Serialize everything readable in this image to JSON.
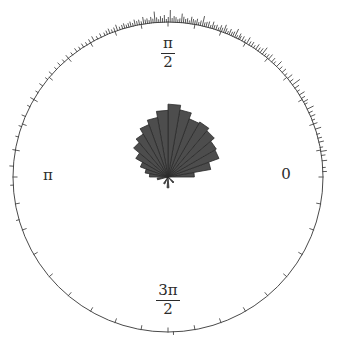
{
  "figure": {
    "kind": "polar-rose-diagram",
    "background_color": "#ffffff",
    "axis_color": "#4a4a4a",
    "petal_fill_color": "#4d4d4d",
    "petal_stroke_color": "#2b2b2b",
    "rug_color": "#3a3a3a",
    "label_color": "#2b2b2b"
  },
  "axis_labels": {
    "right": "0",
    "top_numerator": "π",
    "top_denominator": "2",
    "left": "π",
    "bottom_numerator": "3π",
    "bottom_denominator": "2"
  },
  "chart_data": {
    "type": "bar",
    "subtype": "polar-rose-histogram-with-rug",
    "title": "",
    "xlabel": "",
    "ylabel": "",
    "grid": false,
    "legend": null,
    "angle_unit": "radians",
    "angle_direction": "counterclockwise",
    "angle_zero_at": "east",
    "axis_tick_labels": [
      "0",
      "π/2",
      "π",
      "3π/2"
    ],
    "axis_tick_angles_rad": [
      0,
      1.5708,
      3.1416,
      4.7124
    ],
    "minor_tick_count": 36,
    "minor_tick_spacing_rad": 0.1745,
    "outer_radius_px": 155,
    "center_px": [
      168,
      177
    ],
    "rose": {
      "description": "Angular histogram petals radiating from center; bin width approx 0.175 rad (10 deg); radius proportional to sqrt of bin count; max petal radius approx 0.46 of outer radius.",
      "bin_width_rad": 0.1745,
      "bin_centers_rad": [
        0.0873,
        0.2618,
        0.4363,
        0.6109,
        0.7854,
        0.9599,
        1.1345,
        1.309,
        1.4835,
        1.6581,
        1.8326,
        2.0071,
        2.1817,
        2.3562,
        2.5307,
        2.7053,
        2.8798,
        3.0543,
        3.3161,
        4.1888,
        4.7124,
        5.4978
      ],
      "bin_centers_deg": [
        5,
        15,
        25,
        35,
        45,
        55,
        65,
        75,
        85,
        95,
        105,
        115,
        125,
        135,
        145,
        155,
        165,
        175,
        190,
        240,
        270,
        315
      ],
      "counts": [
        9,
        24,
        38,
        41,
        46,
        52,
        49,
        61,
        70,
        57,
        48,
        40,
        33,
        27,
        19,
        12,
        7,
        5,
        2,
        1,
        2,
        1
      ],
      "radii_fraction_of_outer": [
        0.17,
        0.28,
        0.35,
        0.36,
        0.39,
        0.41,
        0.4,
        0.44,
        0.47,
        0.43,
        0.39,
        0.36,
        0.32,
        0.29,
        0.24,
        0.19,
        0.15,
        0.12,
        0.07,
        0.05,
        0.07,
        0.05
      ]
    },
    "rug": {
      "description": "Individual observations drawn as short radial spikes outside the unit circle; length proportional to local multiplicity.",
      "count": 139,
      "angles_deg": [
        2.0,
        3.5,
        6.0,
        8.0,
        9.5,
        11.0,
        13.0,
        14.5,
        16.0,
        18.0,
        20.0,
        21.5,
        23.0,
        24.5,
        26.0,
        28.0,
        29.0,
        30.5,
        32.0,
        33.5,
        35.0,
        36.5,
        38.0,
        39.5,
        41.0,
        42.5,
        44.0,
        45.5,
        47.0,
        48.0,
        49.5,
        50.5,
        51.5,
        52.5,
        53.5,
        54.5,
        55.5,
        56.5,
        57.5,
        58.5,
        59.5,
        60.5,
        61.5,
        62.5,
        63.0,
        63.8,
        64.5,
        65.3,
        66.0,
        66.8,
        67.5,
        68.3,
        69.0,
        69.8,
        70.5,
        71.2,
        72.0,
        72.8,
        73.5,
        74.2,
        75.0,
        75.8,
        76.5,
        77.2,
        78.0,
        78.7,
        79.4,
        80.1,
        80.8,
        81.5,
        82.2,
        82.9,
        83.6,
        84.3,
        85.0,
        85.7,
        86.4,
        87.1,
        87.8,
        88.5,
        89.2,
        89.9,
        90.6,
        91.3,
        92.0,
        92.7,
        93.4,
        94.1,
        94.8,
        95.5,
        96.2,
        96.9,
        97.6,
        98.3,
        99.0,
        99.8,
        100.6,
        101.4,
        102.2,
        103.0,
        103.8,
        104.6,
        105.4,
        106.2,
        107.0,
        108.0,
        109.0,
        110.0,
        111.0,
        112.0,
        113.0,
        114.0,
        115.5,
        117.0,
        118.5,
        120.0,
        121.5,
        123.0,
        124.5,
        126.0,
        128.0,
        130.0,
        132.0,
        134.0,
        136.0,
        138.5,
        141.0,
        144.0,
        147.0,
        150.0,
        153.0,
        157.0,
        161.0,
        165.0,
        170.0,
        176.0,
        183.0,
        196.0,
        272.0
      ],
      "lengths_px": [
        4,
        3,
        5,
        4,
        6,
        3,
        5,
        4,
        3,
        6,
        4,
        3,
        5,
        4,
        7,
        3,
        5,
        4,
        6,
        3,
        5,
        9,
        4,
        6,
        3,
        5,
        4,
        7,
        3,
        5,
        6,
        4,
        3,
        8,
        5,
        4,
        6,
        3,
        5,
        4,
        7,
        3,
        5,
        4,
        6,
        3,
        9,
        5,
        4,
        6,
        3,
        5,
        8,
        4,
        6,
        3,
        5,
        4,
        7,
        3,
        6,
        5,
        4,
        10,
        5,
        3,
        6,
        4,
        5,
        7,
        3,
        5,
        4,
        6,
        9,
        4,
        3,
        5,
        6,
        4,
        12,
        5,
        3,
        7,
        4,
        6,
        3,
        5,
        11,
        4,
        6,
        3,
        5,
        4,
        7,
        3,
        5,
        4,
        6,
        3,
        5,
        4,
        3,
        5,
        4,
        3,
        6,
        4,
        3,
        5,
        4,
        3,
        4,
        3,
        5,
        4,
        3,
        4,
        3,
        4,
        3,
        4,
        3,
        4,
        3,
        4,
        3,
        4,
        3,
        4,
        3,
        4,
        3,
        3,
        3,
        4,
        3,
        3,
        3
      ]
    }
  }
}
